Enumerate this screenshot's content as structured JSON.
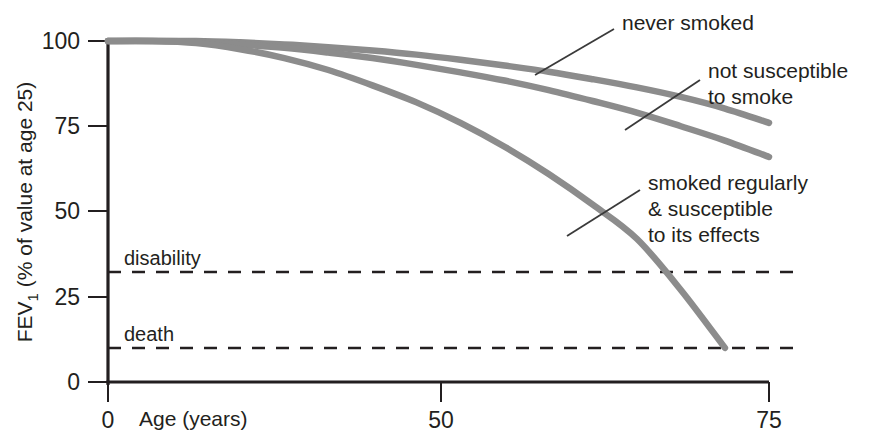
{
  "chart_data": {
    "type": "line",
    "title": "",
    "xlabel": "Age (years)",
    "ylabel": "FEV1 (% of value at age 25)",
    "ylabel_main": "FEV",
    "ylabel_sub": "1",
    "ylabel_rest": " (% of value at age 25)",
    "xlim": [
      0,
      75
    ],
    "ylim": [
      0,
      100
    ],
    "xticks": [
      "0",
      "50",
      "75"
    ],
    "xtick_values": [
      0,
      50,
      75
    ],
    "yticks": [
      "0",
      "25",
      "50",
      "75",
      "100"
    ],
    "ytick_values": [
      0,
      25,
      50,
      75,
      100
    ],
    "grid": false,
    "legend_position": "inline-annotations",
    "series": [
      {
        "name": "never smoked",
        "x": [
          0,
          5,
          10,
          15,
          20,
          25,
          30,
          35,
          40,
          45,
          50,
          55,
          60,
          65,
          70,
          75
        ],
        "values": [
          100,
          100,
          100,
          99.6,
          99,
          98.2,
          97.2,
          96,
          94.5,
          92.8,
          91,
          88.8,
          86.4,
          83.6,
          80.2,
          76
        ]
      },
      {
        "name": "not susceptible to smoke",
        "x": [
          0,
          5,
          10,
          15,
          20,
          25,
          30,
          35,
          40,
          45,
          50,
          55,
          60,
          65,
          70,
          75
        ],
        "values": [
          100,
          100,
          99.8,
          99,
          98,
          96.6,
          95,
          93,
          90.8,
          88.4,
          85.6,
          82.4,
          79,
          75,
          70.8,
          66
        ]
      },
      {
        "name": "smoked regularly & susceptible to its effects",
        "x": [
          0,
          5,
          10,
          15,
          20,
          25,
          30,
          35,
          40,
          45,
          50,
          55,
          60,
          65,
          70
        ],
        "values": [
          100,
          100,
          99.4,
          97.6,
          95,
          91.5,
          87,
          82,
          76,
          69,
          61,
          52,
          42,
          27,
          10
        ]
      }
    ],
    "thresholds": [
      {
        "label": "disability",
        "value": 32
      },
      {
        "label": "death",
        "value": 10
      }
    ],
    "annotations": [
      {
        "label_lines": [
          "never smoked"
        ],
        "target_series": "never smoked"
      },
      {
        "label_lines": [
          "not susceptible",
          "to smoke"
        ],
        "target_series": "not susceptible to smoke"
      },
      {
        "label_lines": [
          "smoked regularly",
          "& susceptible",
          "to its effects"
        ],
        "target_series": "smoked regularly & susceptible to its effects"
      }
    ],
    "colors": {
      "curve": "#8c8c8c",
      "axis": "#231f20",
      "threshold": "#231f20",
      "leader": "#3a3a3a",
      "text": "#231f20",
      "background": "#ffffff"
    }
  },
  "labels": {
    "annot_never_smoked": "never smoked",
    "annot_not_susceptible_1": "not susceptible",
    "annot_not_susceptible_2": "to smoke",
    "annot_smoked_1": "smoked regularly",
    "annot_smoked_2": "& susceptible",
    "annot_smoked_3": "to its effects",
    "threshold_disability": "disability",
    "threshold_death": "death",
    "xaxis_title": "Age (years)",
    "ytick_0": "0",
    "ytick_25": "25",
    "ytick_50": "50",
    "ytick_75": "75",
    "ytick_100": "100",
    "xtick_0": "0",
    "xtick_50": "50",
    "xtick_75": "75",
    "yaxis_main": "FEV",
    "yaxis_sub": "1",
    "yaxis_rest": " (% of value at age 25)"
  }
}
